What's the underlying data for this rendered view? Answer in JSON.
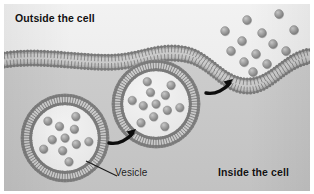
{
  "figure": {
    "title_visible": false,
    "background_color": "#d8d8d8",
    "outside_color": "#ededed",
    "inside_color": "#c9c9c9",
    "membrane_color": "#8f8f8f",
    "membrane_head_color": "#7d7d7d",
    "particle_color": "#9b9b9b",
    "arrow_color": "#0d0d0d",
    "text_color": "#111111"
  },
  "labels": {
    "outside": "Outside the cell",
    "inside": "Inside the cell",
    "vesicle": "Vesicle"
  },
  "membrane": {
    "name": "plasma-membrane",
    "type": "phospholipid-bilayer",
    "lipid_count": 96,
    "description": "wavy bilayer spanning full width with downward invagination on the right"
  },
  "vesicles": [
    {
      "name": "free-vesicle",
      "cx": 61,
      "cy": 134,
      "radius": 44,
      "cargo_count": 11,
      "state": "free-in-cytoplasm"
    },
    {
      "name": "fusing-vesicle",
      "cx": 152,
      "cy": 100,
      "radius": 44,
      "cargo_count": 12,
      "state": "fusing-with-membrane"
    }
  ],
  "released_particles": {
    "name": "released-cargo",
    "count": 13,
    "points": [
      [
        243,
        16
      ],
      [
        275,
        10
      ],
      [
        221,
        27
      ],
      [
        258,
        29
      ],
      [
        290,
        26
      ],
      [
        238,
        37
      ],
      [
        269,
        40
      ],
      [
        227,
        47
      ],
      [
        252,
        50
      ],
      [
        282,
        47
      ],
      [
        240,
        58
      ],
      [
        263,
        60
      ],
      [
        249,
        68
      ]
    ]
  },
  "arrows": [
    {
      "name": "arrow-vesicle-to-membrane",
      "x": 105,
      "y": 128,
      "direction": "up-right"
    },
    {
      "name": "arrow-release-direction",
      "x": 202,
      "y": 78,
      "direction": "up-right"
    }
  ],
  "leader_line": {
    "name": "vesicle-leader-line",
    "from": [
      113,
      172
    ],
    "to": [
      82,
      157
    ]
  }
}
